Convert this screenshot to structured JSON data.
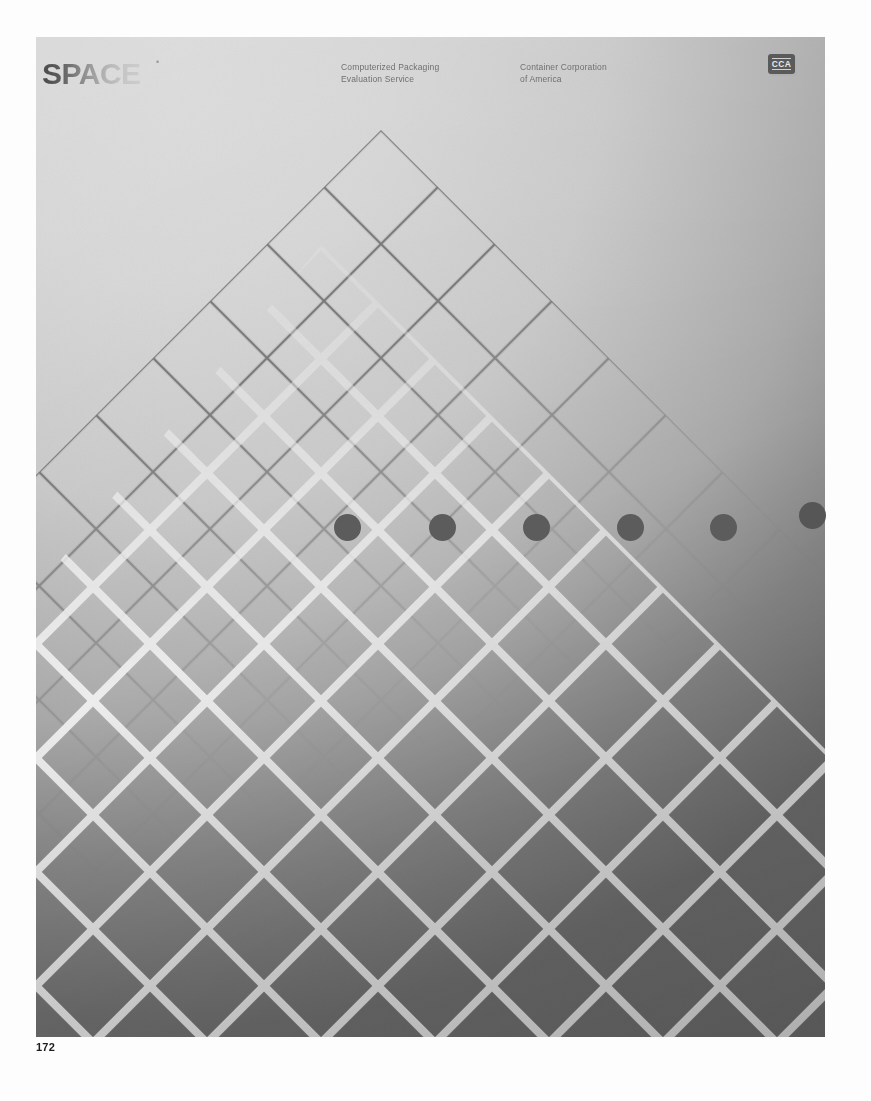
{
  "page": {
    "number": "172",
    "sheet": {
      "x": 36,
      "y": 37,
      "width": 789,
      "height": 1000
    }
  },
  "header": {
    "logo": {
      "text": "SPACE",
      "trademark": "•"
    },
    "caption_left": {
      "line1": "Computerized Packaging",
      "line2": "Evaluation Service"
    },
    "caption_right": {
      "line1": "Container Corporation",
      "line2": "of America"
    },
    "brand_mark": {
      "text": "CCA",
      "name": "cca-logo"
    }
  },
  "artwork": {
    "description": "Two overlapping isometric diamond grids over a light-to-dark gray gradient field",
    "grids": [
      {
        "name": "thin-dark-grid",
        "apex_x": 345,
        "apex_y": 93,
        "cell": 57,
        "line_color": "#6e6e6e",
        "line_width": 2.2
      },
      {
        "name": "thick-light-grid",
        "apex_x": 285,
        "apex_y": 208,
        "cell": 57,
        "line_color": "#f0f0f0",
        "line_width": 7
      }
    ],
    "dots": {
      "name": "dot-row",
      "count": 6,
      "diameter": 27,
      "color": "#5c5c5c",
      "center_y": 490,
      "centers_x": [
        348,
        443,
        537,
        631,
        724,
        813
      ]
    },
    "background": {
      "light": "#d8d8d8",
      "mid": "#ababab",
      "dark": "#6f6f6f"
    }
  },
  "colors": {
    "paper": "#ffffff",
    "ink": "#1d1d1d",
    "caption": "#6f6f6f",
    "mark_plate": "#5a5a5a"
  }
}
